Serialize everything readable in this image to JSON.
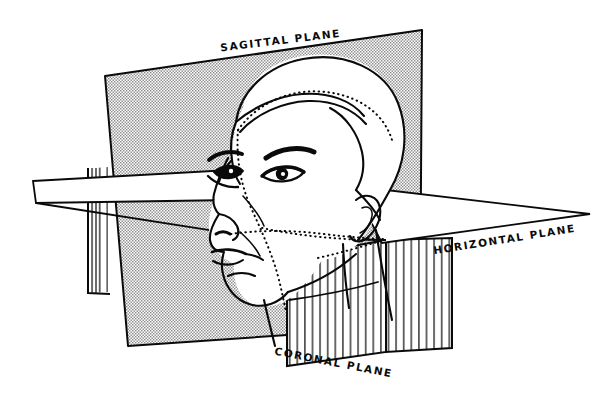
{
  "figure": {
    "background_color": "#ffffff",
    "ink_color": "#0a0a0a",
    "width": 611,
    "height": 402
  },
  "labels": {
    "sagittal": "SAGITTAL PLANE",
    "horizontal": "HORIZONTAL PLANE",
    "coronal": "CORONAL PLANE"
  },
  "planes": [
    {
      "name": "sagittal-plane",
      "label": "SAGITTAL PLANE",
      "fill_style": "halftone-stipple",
      "fill_color": "#d8d8d8",
      "orientation": "vertical-longitudinal",
      "label_rotation_deg": -7
    },
    {
      "name": "horizontal-plane",
      "label": "HORIZONTAL PLANE",
      "fill_style": "none",
      "fill_color": "#ffffff",
      "orientation": "transverse",
      "label_rotation_deg": -9
    },
    {
      "name": "coronal-plane",
      "label": "CORONAL PLANE",
      "fill_style": "vertical-hatch",
      "fill_color": "#ffffff",
      "orientation": "frontal",
      "label_rotation_deg": 11
    }
  ],
  "head": {
    "view": "three-quarter",
    "features": [
      "hair",
      "forehead",
      "eyebrow",
      "eye-right",
      "eye-profile",
      "nose",
      "lips",
      "chin",
      "jaw",
      "ear",
      "neck"
    ],
    "midline_style": "dotted"
  }
}
